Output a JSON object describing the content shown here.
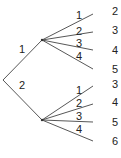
{
  "tree": {
    "first_level": [
      {
        "label": "1",
        "second_level": [
          "1",
          "2",
          "3",
          "4"
        ],
        "outcomes": [
          "2",
          "3",
          "4",
          "5"
        ]
      },
      {
        "label": "2",
        "second_level": [
          "1",
          "2",
          "3",
          "4"
        ],
        "outcomes": [
          "3",
          "4",
          "5",
          "6"
        ]
      }
    ]
  }
}
